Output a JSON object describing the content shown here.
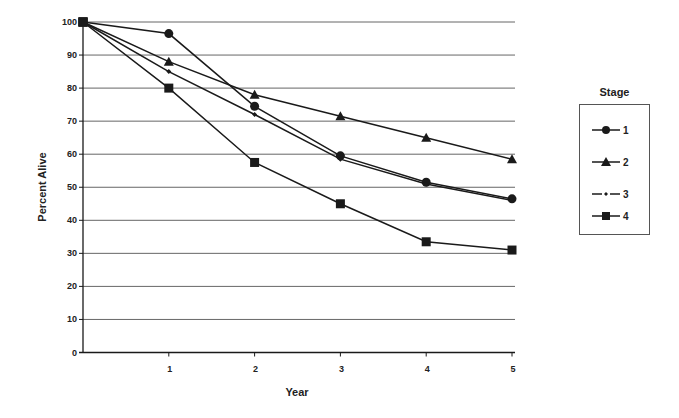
{
  "chart_data": {
    "type": "line",
    "title": "",
    "xlabel": "Year",
    "ylabel": "Percent Alive",
    "x": [
      0,
      1,
      2,
      3,
      4,
      5
    ],
    "x_tick_labels": [
      "1",
      "2",
      "3",
      "4",
      "5"
    ],
    "y_tick_labels": [
      "0",
      "10",
      "20",
      "30",
      "40",
      "50",
      "60",
      "70",
      "80",
      "90",
      "100"
    ],
    "xlim": [
      0,
      5
    ],
    "ylim": [
      0,
      100
    ],
    "grid": "horizontal",
    "legend_title": "Stage",
    "legend_position": "right",
    "series": [
      {
        "name": "1",
        "marker": "circle",
        "values": [
          100,
          96.5,
          74.5,
          59.5,
          51.5,
          46.5
        ]
      },
      {
        "name": "2",
        "marker": "triangle",
        "values": [
          100,
          88,
          78,
          71.5,
          65,
          58.5
        ]
      },
      {
        "name": "3",
        "marker": "diamond",
        "values": [
          100,
          85,
          72,
          58.5,
          51,
          46
        ]
      },
      {
        "name": "4",
        "marker": "square",
        "values": [
          100,
          80,
          57.5,
          45,
          33.5,
          31
        ]
      }
    ]
  },
  "legend": {
    "title": "Stage",
    "items": [
      {
        "label": "1",
        "marker": "circle"
      },
      {
        "label": "2",
        "marker": "triangle"
      },
      {
        "label": "3",
        "marker": "diamond"
      },
      {
        "label": "4",
        "marker": "square"
      }
    ]
  },
  "colors": {
    "line": "#1a1a1a",
    "grid": "#666666"
  }
}
